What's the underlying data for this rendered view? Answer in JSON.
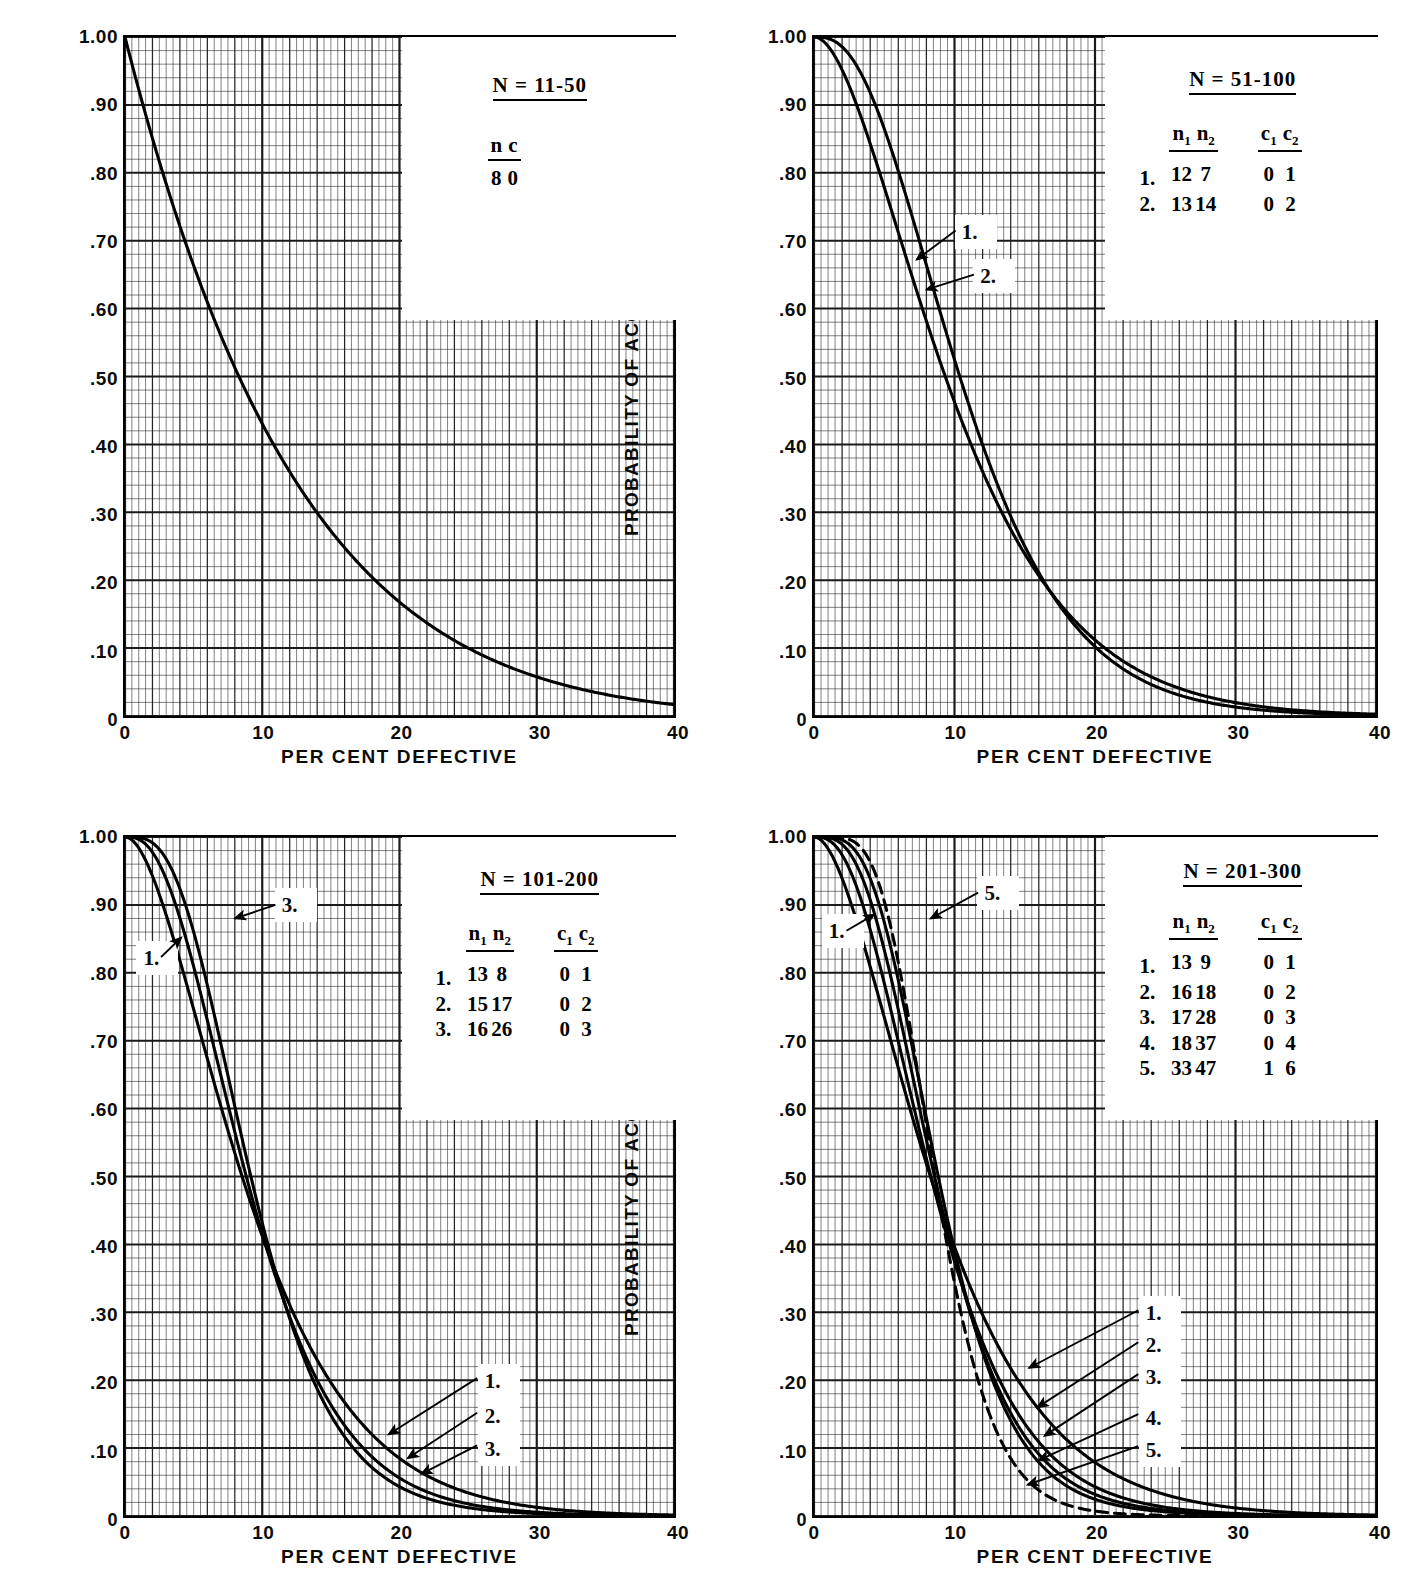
{
  "page": {
    "top_caption": "",
    "axis_x_title": "PER CENT DEFECTIVE",
    "axis_y_title": "PROBABILITY OF ACCEPTANCE",
    "y_ticks": [
      "1.00",
      ".90",
      ".80",
      ".70",
      ".60",
      ".50",
      ".40",
      ".30",
      ".20",
      ".10",
      "0"
    ],
    "x_ticks": [
      "0",
      "10",
      "20",
      "30",
      "40"
    ],
    "ink_color": "#000000",
    "grid_color": "#1a1a1a",
    "paper_color": "#ffffff"
  },
  "panels": [
    {
      "id": "panel-1",
      "legend": {
        "title": "N = 11-50",
        "headers": [
          "n",
          "c"
        ],
        "header_subs": [
          "",
          ""
        ],
        "rows": [
          {
            "index": "",
            "values": [
              "8",
              "0"
            ]
          }
        ]
      },
      "callouts": [],
      "curves": [
        {
          "label": "",
          "n1": 8,
          "c1": 0,
          "n2": 0,
          "c2": 0,
          "style": "solid"
        }
      ]
    },
    {
      "id": "panel-2",
      "legend": {
        "title": "N = 51-100",
        "headers": [
          "n",
          "n",
          "c",
          "c"
        ],
        "header_subs": [
          "1",
          "2",
          "1",
          "2"
        ],
        "rows": [
          {
            "index": "1.",
            "values": [
              "12",
              "7",
              "0",
              "1"
            ]
          },
          {
            "index": "2.",
            "values": [
              "13",
              "14",
              "0",
              "2"
            ]
          }
        ]
      },
      "callouts": [
        {
          "label": "1."
        },
        {
          "label": "2."
        }
      ],
      "curves": [
        {
          "label": "1.",
          "n1": 12,
          "c1": 0,
          "n2": 7,
          "c2": 1,
          "style": "solid"
        },
        {
          "label": "2.",
          "n1": 13,
          "c1": 0,
          "n2": 14,
          "c2": 2,
          "style": "solid"
        }
      ]
    },
    {
      "id": "panel-3",
      "legend": {
        "title": "N = 101-200",
        "headers": [
          "n",
          "n",
          "c",
          "c"
        ],
        "header_subs": [
          "1",
          "2",
          "1",
          "2"
        ],
        "rows": [
          {
            "index": "1.",
            "values": [
              "13",
              "8",
              "0",
              "1"
            ]
          },
          {
            "index": "2.",
            "values": [
              "15",
              "17",
              "0",
              "2"
            ]
          },
          {
            "index": "3.",
            "values": [
              "16",
              "26",
              "0",
              "3"
            ]
          }
        ]
      },
      "callouts": [
        {
          "label": "3."
        },
        {
          "label": "1."
        },
        {
          "label": "1."
        },
        {
          "label": "2."
        },
        {
          "label": "3."
        }
      ],
      "curves": [
        {
          "label": "1.",
          "n1": 13,
          "c1": 0,
          "n2": 8,
          "c2": 1,
          "style": "solid"
        },
        {
          "label": "2.",
          "n1": 15,
          "c1": 0,
          "n2": 17,
          "c2": 2,
          "style": "solid"
        },
        {
          "label": "3.",
          "n1": 16,
          "c1": 0,
          "n2": 26,
          "c2": 3,
          "style": "solid"
        }
      ]
    },
    {
      "id": "panel-4",
      "legend": {
        "title": "N = 201-300",
        "headers": [
          "n",
          "n",
          "c",
          "c"
        ],
        "header_subs": [
          "1",
          "2",
          "1",
          "2"
        ],
        "rows": [
          {
            "index": "1.",
            "values": [
              "13",
              "9",
              "0",
              "1"
            ]
          },
          {
            "index": "2.",
            "values": [
              "16",
              "18",
              "0",
              "2"
            ]
          },
          {
            "index": "3.",
            "values": [
              "17",
              "28",
              "0",
              "3"
            ]
          },
          {
            "index": "4.",
            "values": [
              "18",
              "37",
              "0",
              "4"
            ]
          },
          {
            "index": "5.",
            "values": [
              "33",
              "47",
              "1",
              "6"
            ]
          }
        ]
      },
      "callouts": [
        {
          "label": "5."
        },
        {
          "label": "1."
        },
        {
          "label": "1."
        },
        {
          "label": "2."
        },
        {
          "label": "3."
        },
        {
          "label": "4."
        },
        {
          "label": "5."
        }
      ],
      "curves": [
        {
          "label": "1.",
          "n1": 13,
          "c1": 0,
          "n2": 9,
          "c2": 1,
          "style": "solid"
        },
        {
          "label": "2.",
          "n1": 16,
          "c1": 0,
          "n2": 18,
          "c2": 2,
          "style": "solid"
        },
        {
          "label": "3.",
          "n1": 17,
          "c1": 0,
          "n2": 28,
          "c2": 3,
          "style": "solid"
        },
        {
          "label": "4.",
          "n1": 18,
          "c1": 0,
          "n2": 37,
          "c2": 4,
          "style": "solid"
        },
        {
          "label": "5.",
          "n1": 33,
          "c1": 1,
          "n2": 47,
          "c2": 6,
          "style": "dashed"
        }
      ]
    }
  ],
  "chart_data": {
    "type": "line",
    "xlabel": "PER CENT DEFECTIVE",
    "ylabel": "PROBABILITY OF ACCEPTANCE",
    "xlim": [
      0,
      40
    ],
    "ylim": [
      0,
      1.0
    ],
    "xticks": [
      0,
      10,
      20,
      30,
      40
    ],
    "yticks": [
      0,
      0.1,
      0.2,
      0.3,
      0.4,
      0.5,
      0.6,
      0.7,
      0.8,
      0.9,
      1.0
    ],
    "grid": true,
    "legend_position": "inset-top-right",
    "subplots": [
      {
        "name": "N = 11-50",
        "sampling": "single",
        "series": [
          {
            "name": "n=8, c=0",
            "x": [
              0,
              2,
              4,
              6,
              8,
              10,
              12,
              14,
              16,
              18,
              20,
              24,
              28,
              32,
              36,
              40
            ],
            "values": [
              1.0,
              0.851,
              0.721,
              0.61,
              0.513,
              0.43,
              0.36,
              0.299,
              0.248,
              0.204,
              0.168,
              0.111,
              0.072,
              0.046,
              0.028,
              0.017
            ]
          }
        ]
      },
      {
        "name": "N = 51-100",
        "sampling": "double",
        "series": [
          {
            "name": "1. n1=12, n2=7, c1=0, c2=1",
            "x": [
              0,
              2,
              4,
              6,
              8,
              10,
              12,
              14,
              16,
              18,
              20,
              24,
              28,
              32,
              36,
              40
            ],
            "values": [
              1.0,
              0.975,
              0.906,
              0.808,
              0.697,
              0.586,
              0.483,
              0.392,
              0.313,
              0.247,
              0.193,
              0.114,
              0.065,
              0.036,
              0.019,
              0.01
            ]
          },
          {
            "name": "2. n1=13, n2=14, c1=0, c2=2",
            "x": [
              0,
              2,
              4,
              6,
              8,
              10,
              12,
              14,
              16,
              18,
              20,
              24,
              28,
              32,
              36,
              40
            ],
            "values": [
              1.0,
              0.988,
              0.94,
              0.858,
              0.753,
              0.639,
              0.527,
              0.424,
              0.334,
              0.258,
              0.196,
              0.108,
              0.056,
              0.028,
              0.013,
              0.006
            ]
          }
        ]
      },
      {
        "name": "N = 101-200",
        "sampling": "double",
        "series": [
          {
            "name": "1. n1=13, n2=8, c1=0, c2=1",
            "x": [
              0,
              2,
              4,
              6,
              8,
              10,
              12,
              14,
              16,
              18,
              20,
              24,
              28,
              32,
              36,
              40
            ],
            "values": [
              1.0,
              0.972,
              0.897,
              0.793,
              0.678,
              0.566,
              0.463,
              0.373,
              0.296,
              0.232,
              0.18,
              0.105,
              0.059,
              0.032,
              0.017,
              0.008
            ]
          },
          {
            "name": "2. n1=15, n2=17, c1=0, c2=2",
            "x": [
              0,
              2,
              4,
              6,
              8,
              10,
              12,
              14,
              16,
              18,
              20,
              24,
              28,
              32,
              36,
              40
            ],
            "values": [
              1.0,
              0.985,
              0.927,
              0.832,
              0.716,
              0.597,
              0.484,
              0.383,
              0.297,
              0.226,
              0.169,
              0.09,
              0.045,
              0.021,
              0.01,
              0.004
            ]
          },
          {
            "name": "3. n1=16, n2=26, c1=0, c2=3",
            "x": [
              0,
              2,
              4,
              6,
              8,
              10,
              12,
              14,
              16,
              18,
              20,
              24,
              28,
              32,
              36,
              40
            ],
            "values": [
              1.0,
              0.993,
              0.953,
              0.869,
              0.754,
              0.628,
              0.506,
              0.396,
              0.302,
              0.225,
              0.164,
              0.082,
              0.038,
              0.016,
              0.007,
              0.003
            ]
          }
        ]
      },
      {
        "name": "N = 201-300",
        "sampling": "double",
        "series": [
          {
            "name": "1. n1=13, n2=9, c1=0, c2=1",
            "x": [
              0,
              2,
              4,
              6,
              8,
              10,
              12,
              14,
              16,
              18,
              20,
              24,
              28,
              32,
              36,
              40
            ],
            "values": [
              1.0,
              0.973,
              0.899,
              0.795,
              0.68,
              0.567,
              0.463,
              0.372,
              0.294,
              0.23,
              0.177,
              0.102,
              0.056,
              0.03,
              0.015,
              0.008
            ]
          },
          {
            "name": "2. n1=16, n2=18, c1=0, c2=2",
            "x": [
              0,
              2,
              4,
              6,
              8,
              10,
              12,
              14,
              16,
              18,
              20,
              24,
              28,
              32,
              36,
              40
            ],
            "values": [
              1.0,
              0.984,
              0.922,
              0.822,
              0.702,
              0.58,
              0.466,
              0.365,
              0.28,
              0.21,
              0.155,
              0.08,
              0.039,
              0.018,
              0.008,
              0.003
            ]
          },
          {
            "name": "3. n1=17, n2=28, c1=0, c2=3",
            "x": [
              0,
              2,
              4,
              6,
              8,
              10,
              12,
              14,
              16,
              18,
              20,
              24,
              28,
              32,
              36,
              40
            ],
            "values": [
              1.0,
              0.992,
              0.946,
              0.854,
              0.731,
              0.599,
              0.474,
              0.364,
              0.272,
              0.199,
              0.142,
              0.068,
              0.03,
              0.013,
              0.005,
              0.002
            ]
          },
          {
            "name": "4. n1=18, n2=37, c1=0, c2=4",
            "x": [
              0,
              2,
              4,
              6,
              8,
              10,
              12,
              14,
              16,
              18,
              20,
              24,
              28,
              32,
              36,
              40
            ],
            "values": [
              1.0,
              0.995,
              0.96,
              0.874,
              0.748,
              0.608,
              0.474,
              0.357,
              0.261,
              0.186,
              0.129,
              0.058,
              0.024,
              0.009,
              0.003,
              0.001
            ]
          },
          {
            "name": "5. n1=33, n2=47, c1=1, c2=6",
            "x": [
              0,
              2,
              4,
              6,
              8,
              10,
              12,
              14,
              16,
              18,
              20,
              24,
              28,
              32,
              36,
              40
            ],
            "values": [
              1.0,
              0.999,
              0.988,
              0.944,
              0.856,
              0.731,
              0.588,
              0.448,
              0.324,
              0.223,
              0.147,
              0.056,
              0.018,
              0.005,
              0.001,
              0.0
            ]
          }
        ]
      }
    ]
  }
}
